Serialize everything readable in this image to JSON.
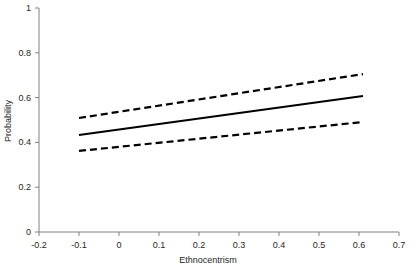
{
  "chart_data": {
    "type": "line",
    "title": "",
    "xlabel": "Ethnocentrism",
    "ylabel": "Probability",
    "xlim": [
      -0.2,
      0.7
    ],
    "ylim": [
      0,
      1
    ],
    "xticks": [
      "-0.2",
      "-0.1",
      "0",
      "0.1",
      "0.2",
      "0.3",
      "0.4",
      "0.5",
      "0.6",
      "0.7"
    ],
    "xtick_values": [
      -0.2,
      -0.1,
      0,
      0.1,
      0.2,
      0.3,
      0.4,
      0.5,
      0.6,
      0.7
    ],
    "yticks": [
      "0",
      "0.2",
      "0.4",
      "0.6",
      "0.8",
      "1"
    ],
    "ytick_values": [
      0,
      0.2,
      0.4,
      0.6,
      0.8,
      1
    ],
    "grid": false,
    "legend": "none",
    "x": [
      -0.1,
      0.61
    ],
    "series": [
      {
        "name": "Predicted probability",
        "style": "solid",
        "color": "#000000",
        "values": [
          0.433,
          0.607
        ]
      },
      {
        "name": "Upper confidence bound",
        "style": "dashed",
        "color": "#000000",
        "values": [
          0.509,
          0.705
        ]
      },
      {
        "name": "Lower confidence bound",
        "style": "dashed",
        "color": "#000000",
        "values": [
          0.362,
          0.491
        ]
      }
    ],
    "axis_color": "#808080",
    "line_color": "#000000"
  }
}
